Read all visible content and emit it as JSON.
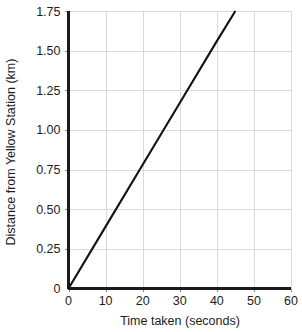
{
  "chart_data": {
    "type": "line",
    "title": "",
    "xlabel": "Time taken (seconds)",
    "ylabel": "Distance from Yellow Station (km)",
    "xlim": [
      0,
      60
    ],
    "ylim": [
      0,
      1.75
    ],
    "grid": true,
    "legend": "none",
    "x_ticks": [
      0,
      10,
      20,
      30,
      40,
      50,
      60
    ],
    "x_tick_labels": [
      "0",
      "10",
      "20",
      "30",
      "40",
      "50",
      "60"
    ],
    "y_ticks": [
      0,
      0.25,
      0.5,
      0.75,
      1.0,
      1.25,
      1.5,
      1.75
    ],
    "y_tick_labels": [
      "0",
      "0.25",
      "0.50",
      "0.75",
      "1.00",
      "1.25",
      "1.50",
      "1.75"
    ],
    "series": [
      {
        "name": "Distance from Yellow Station",
        "color": "#111111",
        "x": [
          0,
          45
        ],
        "values": [
          0,
          1.75
        ],
        "points": [
          {
            "x": 0,
            "y": 0
          },
          {
            "x": 10,
            "y": 0.39
          },
          {
            "x": 20,
            "y": 0.78
          },
          {
            "x": 30,
            "y": 1.17
          },
          {
            "x": 40,
            "y": 1.56
          },
          {
            "x": 45,
            "y": 1.75
          }
        ],
        "slope_km_per_second": 0.0389
      }
    ]
  },
  "colors": {
    "axis": "#1a1a1a",
    "grid": "#d9d9d9",
    "series": "#111111",
    "background": "#ffffff",
    "text": "#1d1d1d"
  }
}
